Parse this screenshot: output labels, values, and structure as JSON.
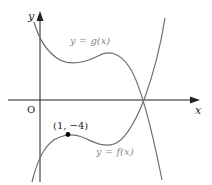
{
  "diagram": {
    "axes": {
      "x_label": "x",
      "y_label": "y",
      "origin_label": "O"
    },
    "curves": [
      {
        "name": "g",
        "label": "y = g(x)",
        "color": "#6e6e6e"
      },
      {
        "name": "f",
        "label": "y = f(x)",
        "color": "#6e6e6e"
      }
    ],
    "points": [
      {
        "label": "(1, −4)",
        "color": "#000000"
      }
    ]
  }
}
